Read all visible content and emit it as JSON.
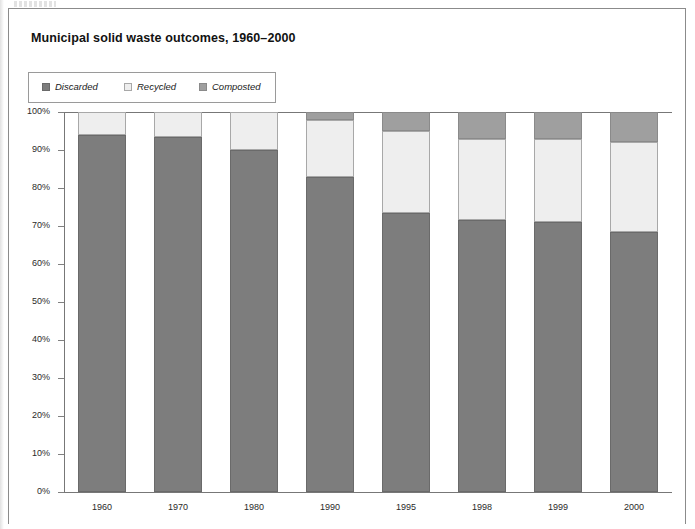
{
  "figure": {
    "title": "Municipal solid waste outcomes, 1960–2000"
  },
  "legend": {
    "entries": [
      {
        "label": "Discarded",
        "color": "#7d7d7d",
        "swatch": "legend-swatch-discarded"
      },
      {
        "label": "Recycled",
        "color": "#eeeeee",
        "swatch": "legend-swatch-recycled"
      },
      {
        "label": "Composted",
        "color": "#9f9f9f",
        "swatch": "legend-swatch-composted"
      }
    ]
  },
  "axes": {
    "y_ticks": [
      "100%",
      "90%",
      "80%",
      "70%",
      "60%",
      "50%",
      "40%",
      "30%",
      "20%",
      "10%",
      "0%"
    ],
    "x_ticks": [
      "1960",
      "1970",
      "1980",
      "1990",
      "1995",
      "1998",
      "1999",
      "2000"
    ]
  },
  "chart_data": {
    "type": "bar",
    "stacked": true,
    "stack_normalized": true,
    "title": "Municipal solid waste outcomes, 1960–2000",
    "xlabel": "",
    "ylabel": "",
    "ylim": [
      0,
      100
    ],
    "ytick_values": [
      0,
      10,
      20,
      30,
      40,
      50,
      60,
      70,
      80,
      90,
      100
    ],
    "ytick_labels": [
      "0%",
      "10%",
      "20%",
      "30%",
      "40%",
      "50%",
      "60%",
      "70%",
      "80%",
      "90%",
      "100%"
    ],
    "grid": false,
    "legend_position": "top-left",
    "categories": [
      "1960",
      "1970",
      "1980",
      "1990",
      "1995",
      "1998",
      "1999",
      "2000"
    ],
    "series": [
      {
        "name": "Discarded",
        "color": "#7d7d7d",
        "values": [
          94.0,
          93.5,
          90.0,
          83.0,
          73.5,
          71.5,
          71.0,
          68.5
        ]
      },
      {
        "name": "Recycled",
        "color": "#eeeeee",
        "values": [
          6.0,
          6.5,
          10.0,
          15.0,
          21.5,
          21.5,
          22.0,
          23.5
        ]
      },
      {
        "name": "Composted",
        "color": "#9f9f9f",
        "values": [
          0.0,
          0.0,
          0.0,
          2.0,
          5.0,
          7.0,
          7.0,
          8.0
        ]
      }
    ]
  }
}
